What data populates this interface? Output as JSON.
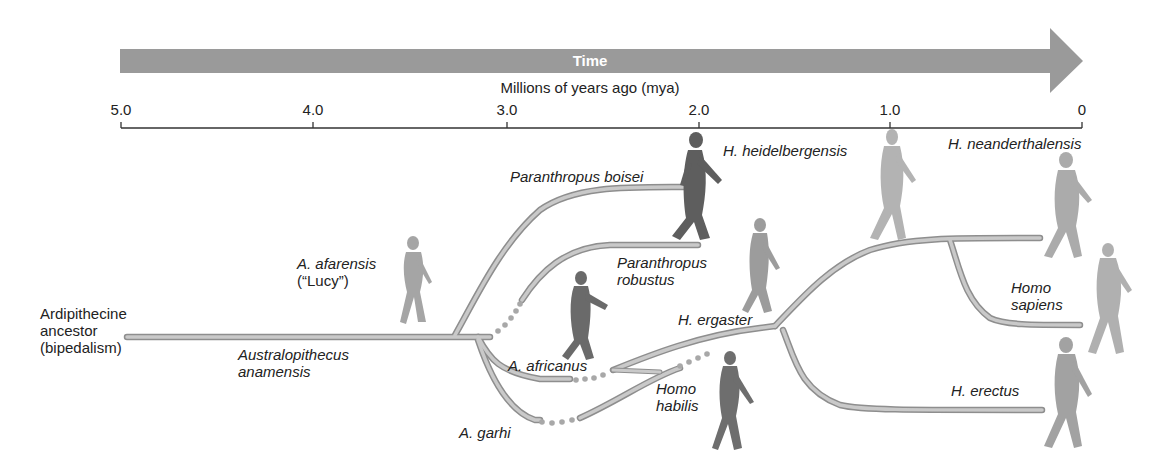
{
  "time_arrow": {
    "label": "Time",
    "color": "#9a9a9a"
  },
  "axis": {
    "title": "Millions of years ago (mya)",
    "ticks": [
      {
        "label": "5.0",
        "value": 5.0
      },
      {
        "label": "4.0",
        "value": 4.0
      },
      {
        "label": "3.0",
        "value": 3.0
      },
      {
        "label": "2.0",
        "value": 2.0
      },
      {
        "label": "1.0",
        "value": 1.0
      },
      {
        "label": "0",
        "value": 0
      }
    ]
  },
  "ancestor": {
    "line1": "Ardipithecine",
    "line2": "ancestor",
    "line3": "(bipedalism)"
  },
  "species": {
    "a_anamensis": {
      "line1": "Australopithecus",
      "line2": "anamensis"
    },
    "a_afarensis": {
      "line1": "A. afarensis",
      "line2": "(“Lucy”)"
    },
    "p_boisei": {
      "line1": "Paranthropus boisei"
    },
    "p_robustus": {
      "line1": "Paranthropus",
      "line2": "robustus"
    },
    "a_africanus": {
      "line1": "A. africanus"
    },
    "a_garhi": {
      "line1": "A. garhi"
    },
    "h_habilis": {
      "line1": "Homo",
      "line2": "habilis"
    },
    "h_ergaster": {
      "line1": "H. ergaster"
    },
    "h_heidelbergensis": {
      "line1": "H. heidelbergensis"
    },
    "h_neanderthalensis": {
      "line1": "H. neanderthalensis"
    },
    "h_sapiens": {
      "line1": "Homo",
      "line2": "sapiens"
    },
    "h_erectus": {
      "line1": "H. erectus"
    }
  },
  "colors": {
    "branch": "#b9b9b9",
    "branch_edge": "#8e8e8e",
    "figure_dark": "#5a5a5a",
    "figure_light": "#b8b8b8",
    "text": "#222222"
  }
}
